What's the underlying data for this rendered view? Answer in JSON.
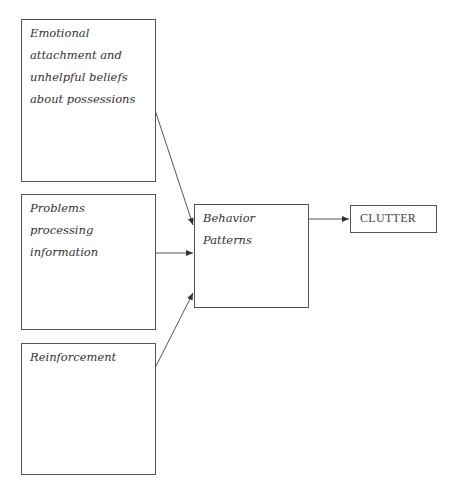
{
  "diagram": {
    "type": "flowchart",
    "nodes": [
      {
        "id": "emotional",
        "label": "Emotional attachment and unhelpful beliefs about possessions"
      },
      {
        "id": "processing",
        "label": "Problems processing information"
      },
      {
        "id": "reinforcement",
        "label": "Reinforcement"
      },
      {
        "id": "behavior",
        "label": "Behavior Patterns"
      },
      {
        "id": "clutter",
        "label": "CLUTTER"
      }
    ],
    "edges": [
      {
        "from": "emotional",
        "to": "behavior"
      },
      {
        "from": "processing",
        "to": "behavior"
      },
      {
        "from": "reinforcement",
        "to": "behavior"
      },
      {
        "from": "behavior",
        "to": "clutter"
      }
    ]
  },
  "colors": {
    "line": "#555555",
    "text": "#333333",
    "background": "#ffffff"
  }
}
